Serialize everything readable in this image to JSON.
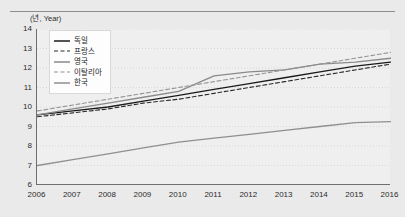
{
  "chart_data": {
    "type": "line",
    "title": "",
    "subtitle": "",
    "xlabel": "(년)",
    "ylabel": "(년, Year)",
    "x": [
      2006,
      2007,
      2008,
      2009,
      2010,
      2011,
      2012,
      2013,
      2014,
      2015,
      2016
    ],
    "categories": [
      "2006",
      "2007",
      "2008",
      "2009",
      "2010",
      "2011",
      "2012",
      "2013",
      "2014",
      "2015",
      "2016"
    ],
    "xlim": [
      2006,
      2016
    ],
    "ylim": [
      6,
      14
    ],
    "yticks": [
      6,
      7,
      8,
      9,
      10,
      11,
      12,
      13,
      14
    ],
    "grid": true,
    "grid_axis": "y",
    "legend_position": "upper-left-inside",
    "series": [
      {
        "name": "독일",
        "style": "solid",
        "color": "#1a1a1a",
        "values": [
          9.6,
          9.8,
          10.0,
          10.3,
          10.6,
          10.9,
          11.2,
          11.5,
          11.8,
          12.1,
          12.3
        ]
      },
      {
        "name": "프랑스",
        "style": "dashed",
        "color": "#2a2a2a",
        "values": [
          9.5,
          9.7,
          9.9,
          10.2,
          10.4,
          10.7,
          11.0,
          11.3,
          11.6,
          11.9,
          12.2
        ]
      },
      {
        "name": "영국",
        "style": "solid",
        "color": "#8a8a8a",
        "values": [
          9.6,
          9.9,
          10.2,
          10.5,
          10.8,
          11.6,
          11.8,
          11.9,
          12.2,
          12.3,
          12.5
        ]
      },
      {
        "name": "이탈리아",
        "style": "dashed",
        "color": "#949494",
        "values": [
          9.8,
          10.1,
          10.4,
          10.7,
          11.0,
          11.3,
          11.6,
          11.9,
          12.2,
          12.5,
          12.8
        ]
      },
      {
        "name": "한국",
        "style": "solid",
        "color": "#8f8f8f",
        "values": [
          7.0,
          7.3,
          7.6,
          7.9,
          8.2,
          8.4,
          8.6,
          8.8,
          9.0,
          9.2,
          9.25
        ]
      }
    ]
  },
  "axis": {
    "y_unit": "(년, Year)",
    "x_unit": "(년)"
  }
}
